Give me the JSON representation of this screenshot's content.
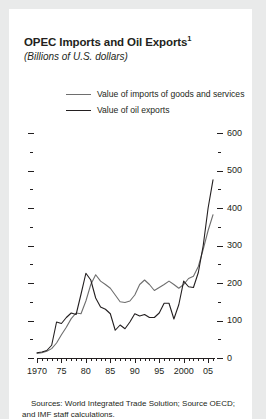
{
  "figure": {
    "title": "OPEC Imports and Oil Exports",
    "title_footnote": "1",
    "subtitle": "(Billions of U.S. dollars)",
    "source_note": "Sources: World Integrated Trade Solution; Source OECD; and IMF staff calculations.",
    "background_color": "#e9eaea",
    "card_color": "#ffffff"
  },
  "legend": {
    "position": "top",
    "entries": [
      {
        "label": "Value of imports of goods and services",
        "color": "#6e6e6e",
        "name": "imports"
      },
      {
        "label": "Value of oil exports",
        "color": "#231f20",
        "name": "oil-exports"
      }
    ]
  },
  "chart_data": {
    "type": "line",
    "title": "OPEC Imports and Oil Exports",
    "subtitle": "(Billions of U.S. dollars)",
    "xlabel": "",
    "ylabel": "Billions of U.S. dollars",
    "xlim": [
      1970,
      2006
    ],
    "ylim": [
      0,
      600
    ],
    "grid": false,
    "y_ticks_major": [
      0,
      100,
      200,
      300,
      400,
      500,
      600
    ],
    "y_ticks_minor": [
      50,
      150,
      250,
      350,
      450,
      550
    ],
    "y_tick_labels": [
      "0",
      "100",
      "200",
      "300",
      "400",
      "500",
      "600"
    ],
    "x_ticks_major": [
      1970,
      1975,
      1980,
      1985,
      1990,
      1995,
      2000,
      2005
    ],
    "x_tick_labels": [
      "1970",
      "75",
      "80",
      "85",
      "90",
      "95",
      "2000",
      "05"
    ],
    "x_minor_tick_interval": 1,
    "x": [
      1970,
      1971,
      1972,
      1973,
      1974,
      1975,
      1976,
      1977,
      1978,
      1979,
      1980,
      1981,
      1982,
      1983,
      1984,
      1985,
      1986,
      1987,
      1988,
      1989,
      1990,
      1991,
      1992,
      1993,
      1994,
      1995,
      1996,
      1997,
      1998,
      1999,
      2000,
      2001,
      2002,
      2003,
      2004,
      2005,
      2006
    ],
    "series": [
      {
        "name": "Value of imports of goods and services",
        "color": "#6e6e6e",
        "values": [
          12,
          14,
          18,
          25,
          40,
          62,
          82,
          105,
          120,
          118,
          152,
          196,
          222,
          205,
          196,
          186,
          168,
          150,
          148,
          152,
          168,
          196,
          208,
          196,
          180,
          188,
          196,
          205,
          196,
          186,
          196,
          212,
          218,
          244,
          290,
          340,
          382
        ]
      },
      {
        "name": "Value of oil exports",
        "color": "#231f20",
        "values": [
          14,
          16,
          20,
          34,
          96,
          92,
          108,
          120,
          116,
          170,
          226,
          208,
          160,
          136,
          130,
          118,
          74,
          88,
          78,
          96,
          118,
          112,
          116,
          108,
          108,
          120,
          146,
          146,
          104,
          142,
          205,
          190,
          188,
          228,
          300,
          400,
          475
        ]
      }
    ]
  }
}
